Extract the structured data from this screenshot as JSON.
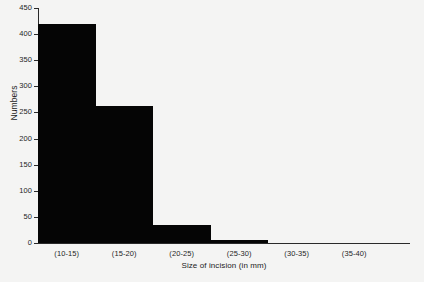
{
  "chart_data": {
    "type": "bar",
    "title": "",
    "xlabel": "Size of incision (in mm)",
    "ylabel": "Numbers",
    "categories": [
      "(10-15)",
      "(15-20)",
      "(20-25)",
      "(25-30)",
      "(30-35)",
      "(35-40)"
    ],
    "values": [
      420,
      262,
      34,
      6,
      0,
      0
    ],
    "ylim": [
      0,
      450
    ],
    "yticks": [
      0,
      50,
      100,
      150,
      200,
      250,
      300,
      350,
      400,
      450
    ],
    "ytick_labels": [
      "0",
      "50",
      "100",
      "150",
      "200",
      "250",
      "300",
      "350",
      "400",
      "450"
    ],
    "grid": false,
    "legend": false,
    "bar_color": "#050505",
    "axis_color": "#2a2a2a",
    "background_color": "#f4f4f3",
    "bars_drawn": 4
  }
}
